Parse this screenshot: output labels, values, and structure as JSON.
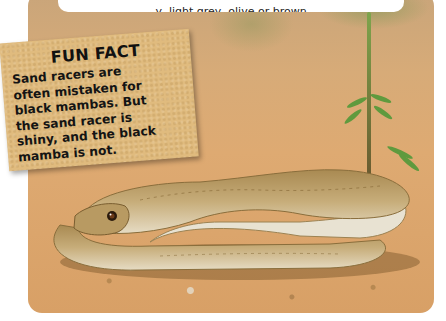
{
  "caption": {
    "text": "...y, light grey, olive or brown..."
  },
  "fun_fact": {
    "title": "FUN FACT",
    "lines": [
      "Sand racers are",
      "often mistaken for",
      "black mambas. But",
      "the sand racer is",
      "shiny, and the black",
      "mamba is not."
    ]
  },
  "photo": {
    "subject": "sand racer snake coiled on sand with small green plant",
    "colors": {
      "sand": "#dba56c",
      "snake_body": "#b89a62",
      "snake_belly": "#e8e0cc",
      "plant": "#5f9a3e",
      "card": "#e0bb7e"
    }
  }
}
